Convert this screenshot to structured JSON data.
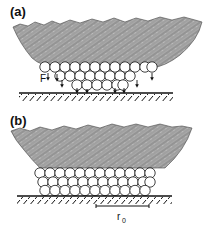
{
  "figure": {
    "panels": [
      {
        "id": "a",
        "label": "(a)",
        "force_label": "F",
        "description": "Rough particle pressing on a curved layer of spheres above a hatched substrate; arrows indicate downward force F"
      },
      {
        "id": "b",
        "label": "(b)",
        "scale_label": "r",
        "scale_subscript": "0",
        "description": "Particle resting on a flat multilayer of spheres over the hatched substrate, with scale bar r0"
      }
    ],
    "colors": {
      "particle_fill": "#a8a8a8",
      "particle_texture": "#7d7d7d",
      "sphere_fill": "#ffffff",
      "line": "#111111"
    }
  }
}
